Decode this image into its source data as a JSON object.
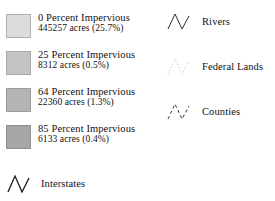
{
  "legend": {
    "title": "Map Legend",
    "swatch_entries": [
      {
        "name": "impervious-0",
        "title": "0 Percent Impervious",
        "sub": "445257 acres (25.7%)",
        "color": "#dcdcdc",
        "border": "#b0b0b0",
        "percent": 0,
        "acres": 445257,
        "share": "25.7%"
      },
      {
        "name": "impervious-25",
        "title": "25 Percent Impervious",
        "sub": "8312 acres (0.5%)",
        "color": "#c4c4c4",
        "border": "#a8a8a8",
        "percent": 25,
        "acres": 8312,
        "share": "0.5%"
      },
      {
        "name": "impervious-64",
        "title": "64 Percent Impervious",
        "sub": "22360 acres (1.3%)",
        "color": "#b4b4b4",
        "border": "#9c9c9c",
        "percent": 64,
        "acres": 22360,
        "share": "1.3%"
      },
      {
        "name": "impervious-85",
        "title": "85 Percent Impervious",
        "sub": "6133 acres (0.4%)",
        "color": "#a6a6a6",
        "border": "#909090",
        "percent": 85,
        "acres": 6133,
        "share": "0.4%"
      }
    ],
    "line_entries": [
      {
        "name": "interstates",
        "label": "Interstates",
        "icon": "zigzag-line-icon",
        "style": "solid",
        "color": "#1a1a1a",
        "width": 1.3
      },
      {
        "name": "rivers",
        "label": "Rivers",
        "icon": "zigzag-line-icon",
        "style": "solid",
        "color": "#303030",
        "width": 1.0
      },
      {
        "name": "federal-lands",
        "label": "Federal Lands",
        "icon": "zigzag-line-icon",
        "style": "dotted",
        "color": "#b9b9b9",
        "width": 1.0
      },
      {
        "name": "counties",
        "label": "Counties",
        "icon": "zigzag-line-icon",
        "style": "dashed",
        "color": "#3a3a3a",
        "width": 1.0
      }
    ]
  }
}
